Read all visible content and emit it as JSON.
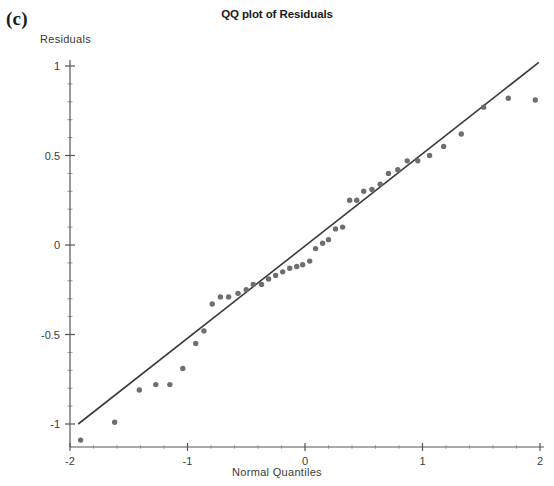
{
  "panel": {
    "label": "(c)"
  },
  "chart_data": {
    "type": "scatter",
    "title": "QQ plot of Residuals",
    "xlabel": "Normal Quantiles",
    "ylabel": "Residuals",
    "xlim": [
      -2,
      2
    ],
    "ylim": [
      -1.15,
      1.05
    ],
    "grid": false,
    "legend": null,
    "xticks": [
      -2,
      -1,
      0,
      1,
      2
    ],
    "xtick_labels": [
      "-2",
      "-1",
      "0",
      "1",
      "2"
    ],
    "yticks": [
      -1,
      -0.5,
      0,
      0.5,
      1
    ],
    "ytick_labels": [
      "-1",
      "-0.5",
      "0",
      "0.5",
      "1"
    ],
    "point_color": "#6e6e6e",
    "line_color": "#3a3a3a",
    "axis_color": "#555555",
    "reference_line": {
      "name": "normal-reference-line",
      "x": [
        -1.93,
        1.99
      ],
      "y": [
        -1.0,
        1.02
      ]
    },
    "series": [
      {
        "name": "residual-quantiles",
        "points": [
          [
            -1.91,
            -1.09
          ],
          [
            -1.62,
            -0.99
          ],
          [
            -1.41,
            -0.81
          ],
          [
            -1.27,
            -0.78
          ],
          [
            -1.15,
            -0.78
          ],
          [
            -1.04,
            -0.69
          ],
          [
            -0.93,
            -0.55
          ],
          [
            -0.86,
            -0.48
          ],
          [
            -0.79,
            -0.33
          ],
          [
            -0.72,
            -0.29
          ],
          [
            -0.65,
            -0.29
          ],
          [
            -0.57,
            -0.27
          ],
          [
            -0.5,
            -0.25
          ],
          [
            -0.44,
            -0.22
          ],
          [
            -0.37,
            -0.22
          ],
          [
            -0.31,
            -0.19
          ],
          [
            -0.25,
            -0.17
          ],
          [
            -0.19,
            -0.15
          ],
          [
            -0.13,
            -0.13
          ],
          [
            -0.07,
            -0.12
          ],
          [
            -0.02,
            -0.11
          ],
          [
            0.04,
            -0.09
          ],
          [
            0.09,
            -0.02
          ],
          [
            0.15,
            0.01
          ],
          [
            0.2,
            0.03
          ],
          [
            0.26,
            0.09
          ],
          [
            0.32,
            0.1
          ],
          [
            0.38,
            0.25
          ],
          [
            0.44,
            0.25
          ],
          [
            0.5,
            0.3
          ],
          [
            0.57,
            0.31
          ],
          [
            0.64,
            0.34
          ],
          [
            0.71,
            0.4
          ],
          [
            0.79,
            0.42
          ],
          [
            0.87,
            0.47
          ],
          [
            0.96,
            0.47
          ],
          [
            1.06,
            0.5
          ],
          [
            1.18,
            0.55
          ],
          [
            1.33,
            0.62
          ],
          [
            1.52,
            0.77
          ],
          [
            1.73,
            0.82
          ],
          [
            1.96,
            0.81
          ]
        ]
      }
    ]
  }
}
